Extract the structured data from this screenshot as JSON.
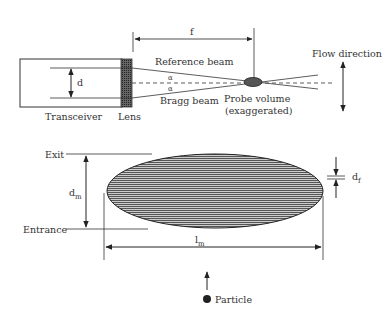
{
  "diagram": {
    "top": {
      "focal_label": "f",
      "reference_beam_label": "Reference beam",
      "bragg_beam_label": "Bragg beam",
      "alpha_label": "α",
      "d_label": "d",
      "transceiver_label": "Transceiver",
      "lens_label": "Lens",
      "probe_volume_label": "Probe volume",
      "probe_volume_sublabel": "(exaggerated)",
      "flow_direction_label": "Flow direction"
    },
    "bottom": {
      "exit_label": "Exit",
      "entrance_label": "Entrance",
      "dm_label": "d",
      "dm_sub": "m",
      "lm_label": "l",
      "lm_sub": "m",
      "df_label": "d",
      "df_sub": "f",
      "particle_label": "Particle"
    },
    "colors": {
      "line": "#333333",
      "fill": "#555555",
      "background": "#ffffff"
    }
  }
}
